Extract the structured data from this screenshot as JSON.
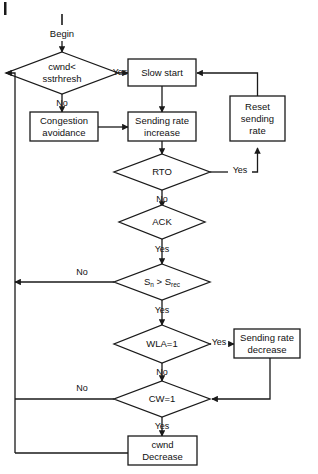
{
  "diagram": {
    "start_label": "Begin",
    "stroke_color": "#1a1a1a",
    "background_color": "#ffffff"
  },
  "nodes": {
    "cwnd_check": {
      "line1": "cwnd<",
      "line2": "sstrhresh",
      "type": "decision"
    },
    "slow_start": {
      "line1": "Slow start",
      "type": "process"
    },
    "congestion_avoidance": {
      "line1": "Congestion",
      "line2": "avoidance",
      "type": "process"
    },
    "sending_rate_increase": {
      "line1": "Sending rate",
      "line2": "increase",
      "type": "process"
    },
    "reset_sending_rate": {
      "line1": "Reset",
      "line2": "sending",
      "line3": "rate",
      "type": "process"
    },
    "rto": {
      "line1": "RTO",
      "type": "decision"
    },
    "ack": {
      "line1": "ACK",
      "type": "decision"
    },
    "sn_srec": {
      "prefix": "S",
      "sub1": "n",
      "mid": " > S",
      "sub2": "rec",
      "type": "decision"
    },
    "wla": {
      "line1": "WLA=1",
      "type": "decision"
    },
    "sending_rate_decrease": {
      "line1": "Sending rate",
      "line2": "decrease",
      "type": "process"
    },
    "cw": {
      "line1": "CW=1",
      "type": "decision"
    },
    "cwnd_decrease": {
      "line1": "cwnd",
      "line2": "Decrease",
      "type": "process"
    }
  },
  "edge_labels": {
    "cwnd_yes": "Yes",
    "cwnd_no": "No",
    "rto_yes": "Yes",
    "rto_no": "No",
    "ack_yes": "Yes",
    "sn_no": "No",
    "sn_yes": "Yes",
    "wla_yes": "Yes",
    "wla_no": "No",
    "cw_no": "No",
    "cw_yes": "Yes"
  }
}
